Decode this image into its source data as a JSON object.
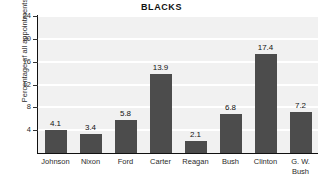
{
  "chart_data": {
    "type": "bar",
    "title": "BLACKS",
    "xlabel": "",
    "ylabel": "Percentage of all appointments",
    "categories": [
      "Johnson",
      "Nixon",
      "Ford",
      "Carter",
      "Reagan",
      "Bush",
      "Clinton",
      "G. W.\nBush"
    ],
    "values": [
      4.1,
      3.4,
      5.8,
      13.9,
      2.1,
      6.8,
      17.4,
      7.2
    ],
    "value_labels": [
      "4.1",
      "3.4",
      "5.8",
      "13.9",
      "2.1",
      "6.8",
      "17.4",
      "7.2"
    ],
    "ylim": [
      0,
      24
    ],
    "yticks": [
      4,
      8,
      12,
      16,
      20,
      24
    ],
    "ytick_labels": [
      "4",
      "8",
      "12",
      "16",
      "20",
      "24"
    ],
    "grid": true,
    "legend": false,
    "colors": {
      "bar": "#4c4c4c",
      "plot_background": "#f1f1f1",
      "gridline": "#ffffff",
      "axis": "#111111",
      "text": "#2b2b2b",
      "page_background": "#ffffff"
    }
  }
}
